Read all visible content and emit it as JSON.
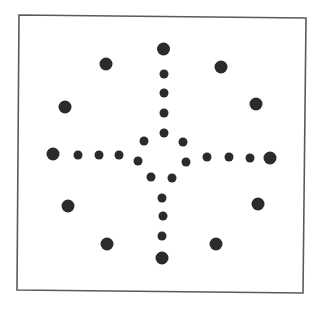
{
  "figure": {
    "background": "#ffffff",
    "frame": {
      "points": [
        [
          19,
          15
        ],
        [
          306,
          18
        ],
        [
          303,
          293
        ],
        [
          17,
          290
        ]
      ],
      "stroke": "#5a5a5a",
      "stroke_width": 1.6
    },
    "dot_color": "#2b2b2b",
    "big_radius": 6.5,
    "small_radius": 4.5,
    "dots": [
      {
        "group": "top-arm",
        "size": "big",
        "x": 163.5,
        "y": 49
      },
      {
        "group": "top-arm",
        "size": "small",
        "x": 164,
        "y": 74
      },
      {
        "group": "top-arm",
        "size": "small",
        "x": 164,
        "y": 93
      },
      {
        "group": "top-arm",
        "size": "small",
        "x": 164,
        "y": 113
      },
      {
        "group": "center-ring",
        "size": "small",
        "x": 164,
        "y": 133
      },
      {
        "group": "center-ring",
        "size": "small",
        "x": 144,
        "y": 141
      },
      {
        "group": "center-ring",
        "size": "small",
        "x": 183,
        "y": 142
      },
      {
        "group": "center-ring",
        "size": "small",
        "x": 138,
        "y": 161
      },
      {
        "group": "center-ring",
        "size": "small",
        "x": 186,
        "y": 162
      },
      {
        "group": "center-ring",
        "size": "small",
        "x": 151,
        "y": 177
      },
      {
        "group": "center-ring",
        "size": "small",
        "x": 172,
        "y": 178
      },
      {
        "group": "left-arm",
        "size": "big",
        "x": 53,
        "y": 154
      },
      {
        "group": "left-arm",
        "size": "small",
        "x": 78,
        "y": 155
      },
      {
        "group": "left-arm",
        "size": "small",
        "x": 99,
        "y": 155
      },
      {
        "group": "left-arm",
        "size": "small",
        "x": 119,
        "y": 155
      },
      {
        "group": "right-arm",
        "size": "small",
        "x": 207,
        "y": 157
      },
      {
        "group": "right-arm",
        "size": "small",
        "x": 229,
        "y": 157
      },
      {
        "group": "right-arm",
        "size": "small",
        "x": 250,
        "y": 158
      },
      {
        "group": "right-arm",
        "size": "big",
        "x": 270,
        "y": 158
      },
      {
        "group": "bottom-arm",
        "size": "small",
        "x": 162,
        "y": 198
      },
      {
        "group": "bottom-arm",
        "size": "small",
        "x": 163,
        "y": 216
      },
      {
        "group": "bottom-arm",
        "size": "small",
        "x": 162,
        "y": 236
      },
      {
        "group": "bottom-arm",
        "size": "big",
        "x": 162,
        "y": 258
      },
      {
        "group": "outer-ring",
        "size": "big",
        "x": 106,
        "y": 64
      },
      {
        "group": "outer-ring",
        "size": "big",
        "x": 221,
        "y": 67
      },
      {
        "group": "outer-ring",
        "size": "big",
        "x": 65,
        "y": 107
      },
      {
        "group": "outer-ring",
        "size": "big",
        "x": 256,
        "y": 104
      },
      {
        "group": "outer-ring",
        "size": "big",
        "x": 68,
        "y": 206
      },
      {
        "group": "outer-ring",
        "size": "big",
        "x": 258,
        "y": 204
      },
      {
        "group": "outer-ring",
        "size": "big",
        "x": 107,
        "y": 244
      },
      {
        "group": "outer-ring",
        "size": "big",
        "x": 216,
        "y": 244
      }
    ]
  }
}
